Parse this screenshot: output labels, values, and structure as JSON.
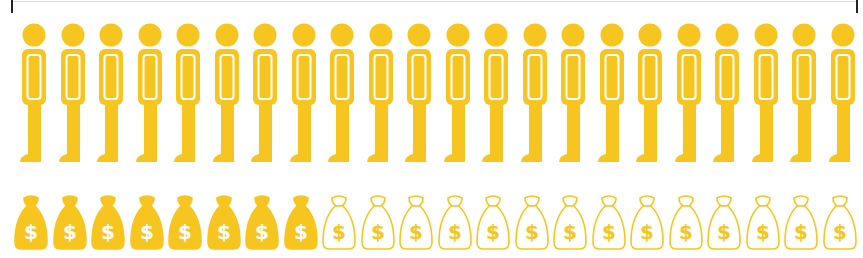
{
  "colors": {
    "accent": "#F7C520",
    "background": "#FFFFFF",
    "outline_inner": "#FFFFFF"
  },
  "people_row": {
    "icon": "person-icon",
    "count": 22,
    "start_x": 18,
    "spacing": 38.5
  },
  "bags_row": {
    "icon": "money-bag-icon",
    "symbol": "$",
    "count": 22,
    "filled": 8,
    "outlined": 14,
    "start_x": 13,
    "spacing": 38.5
  }
}
